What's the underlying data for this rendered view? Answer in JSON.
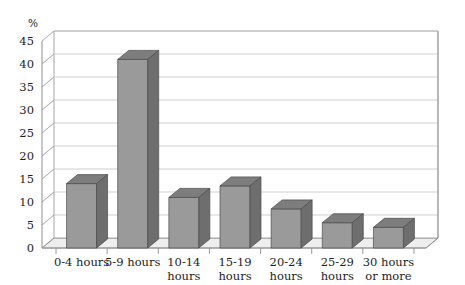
{
  "chart_data": {
    "type": "bar",
    "title": "",
    "subtitle": "",
    "xlabel": "",
    "ylabel": "%",
    "ylim": [
      0,
      45
    ],
    "ytick_step": 5,
    "yticks": [
      0,
      5,
      10,
      15,
      20,
      25,
      30,
      35,
      40,
      45
    ],
    "ytick_labels": [
      "0",
      "5",
      "10",
      "15",
      "20",
      "25",
      "30",
      "35",
      "40",
      "45"
    ],
    "grid": true,
    "legend": "none",
    "three_d": true,
    "categories": [
      "0-4 hours",
      "5-9 hours",
      "10-14 hours",
      "15-19 hours",
      "20-24 hours",
      "25-29 hours",
      "30 hours or more"
    ],
    "category_lines": [
      [
        "0-4 hours"
      ],
      [
        "5-9 hours"
      ],
      [
        "10-14",
        "hours"
      ],
      [
        "15-19",
        "hours"
      ],
      [
        "20-24",
        "hours"
      ],
      [
        "25-29",
        "hours"
      ],
      [
        "30 hours",
        "or more"
      ]
    ],
    "values": [
      14,
      41,
      11,
      13.5,
      8.5,
      5.5,
      4.5
    ],
    "colors": {
      "bar_front": "#9a9a9a",
      "bar_side": "#6e6e6e",
      "bar_top": "#7d7d7d",
      "bar_outline": "#4a4a4a",
      "gridline": "#c9c9c9",
      "axis": "#8f8f8f",
      "floor": "#eeeeee",
      "floor_front": "#e2e2e2",
      "background": "#ffffff",
      "text": "#1d1d1d"
    }
  }
}
